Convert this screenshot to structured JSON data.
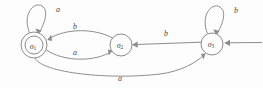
{
  "figure": {
    "kind": "finite-state-automaton-diagram",
    "background_color": "#fdfdfd",
    "stroke_color": "#8d8d8d",
    "text_color": "#4a4a4a"
  },
  "states": [
    {
      "id": "sigma1",
      "symbol": "σ",
      "subscript": "1",
      "accepting": true,
      "initial": false,
      "cx": 34,
      "cy": 45,
      "r": 13,
      "inner_r": 9
    },
    {
      "id": "sigma2",
      "symbol": "σ",
      "subscript": "2",
      "accepting": false,
      "initial": false,
      "cx": 121,
      "cy": 45,
      "r": 11,
      "inner_r": 0
    },
    {
      "id": "sigma3",
      "symbol": "σ",
      "subscript": "3",
      "accepting": false,
      "initial": true,
      "cx": 212,
      "cy": 44,
      "r": 11,
      "inner_r": 0
    }
  ],
  "transitions": [
    {
      "id": "t-sigma1-self",
      "from": "sigma1",
      "to": "sigma1",
      "label": "a",
      "kind": "self-loop",
      "label_x": 58,
      "label_y": 9
    },
    {
      "id": "t-sigma2-sigma1",
      "from": "sigma2",
      "to": "sigma1",
      "label": "b",
      "kind": "curve-upper",
      "label_x": 75,
      "label_y": 26
    },
    {
      "id": "t-sigma1-sigma2",
      "from": "sigma1",
      "to": "sigma2",
      "label": "a",
      "kind": "curve-lower",
      "label_x": 75,
      "label_y": 52
    },
    {
      "id": "t-sigma3-sigma2",
      "from": "sigma3",
      "to": "sigma2",
      "label": "b",
      "kind": "straight",
      "label_x": 166,
      "label_y": 33
    },
    {
      "id": "t-sigma3-self",
      "from": "sigma3",
      "to": "sigma3",
      "label": "b",
      "kind": "self-loop",
      "label_x": 236,
      "label_y": 10
    },
    {
      "id": "t-sigma1-sigma3",
      "from": "sigma1",
      "to": "sigma3",
      "label": "a",
      "kind": "curve-bottom",
      "label_x": 120,
      "label_y": 78
    }
  ],
  "start_arrow": {
    "id": "start-arrow",
    "target": "sigma3",
    "label": ""
  }
}
